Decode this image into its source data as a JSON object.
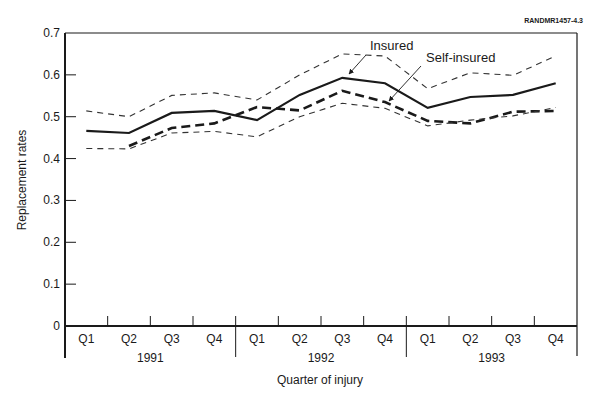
{
  "figure_id": "RANDMR1457-4.3",
  "chart_data": {
    "type": "line",
    "title": "",
    "xlabel": "Quarter of injury",
    "ylabel": "Replacement rates",
    "ylim": [
      0,
      0.7
    ],
    "yticks": [
      "0",
      "0.1",
      "0.2",
      "0.3",
      "0.4",
      "0.5",
      "0.6",
      "0.7"
    ],
    "grid": false,
    "legend": "inline annotations",
    "categories": [
      "Q1 1991",
      "Q2 1991",
      "Q3 1991",
      "Q4 1991",
      "Q1 1992",
      "Q2 1992",
      "Q3 1992",
      "Q4 1992",
      "Q1 1993",
      "Q2 1993",
      "Q3 1993",
      "Q4 1993"
    ],
    "quarter_labels": [
      "Q1",
      "Q2",
      "Q3",
      "Q4",
      "Q1",
      "Q2",
      "Q3",
      "Q4",
      "Q1",
      "Q2",
      "Q3",
      "Q4"
    ],
    "year_labels": [
      "1991",
      "1992",
      "1993"
    ],
    "series": [
      {
        "name": "Insured",
        "style": "solid",
        "values": [
          0.466,
          0.461,
          0.509,
          0.514,
          0.492,
          0.552,
          0.593,
          0.58,
          0.521,
          0.547,
          0.552,
          0.58
        ]
      },
      {
        "name": "Self-insured",
        "style": "dashed-bold",
        "values": [
          null,
          0.43,
          0.473,
          0.484,
          0.523,
          0.515,
          0.562,
          0.535,
          0.49,
          0.484,
          0.512,
          0.514
        ]
      },
      {
        "name": "Upper bound",
        "style": "dashed-thin",
        "values": [
          0.514,
          0.5,
          0.551,
          0.557,
          0.54,
          0.6,
          0.65,
          0.645,
          0.567,
          0.605,
          0.599,
          0.645
        ]
      },
      {
        "name": "Lower bound",
        "style": "dashed-thin",
        "values": [
          0.424,
          0.423,
          0.461,
          0.465,
          0.452,
          0.5,
          0.532,
          0.52,
          0.478,
          0.492,
          0.502,
          0.522
        ]
      }
    ],
    "annotations": [
      {
        "text": "Insured",
        "points_to": "Insured Q3 1992"
      },
      {
        "text": "Self-insured",
        "points_to": "Self-insured Q4 1992"
      }
    ]
  }
}
